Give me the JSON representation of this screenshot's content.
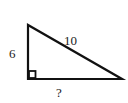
{
  "diagram": {
    "type": "right-triangle",
    "labels": {
      "vertical_leg": "6",
      "hypotenuse": "10",
      "horizontal_leg": "?"
    },
    "right_angle_marker": true,
    "stroke_color": "#111111"
  }
}
